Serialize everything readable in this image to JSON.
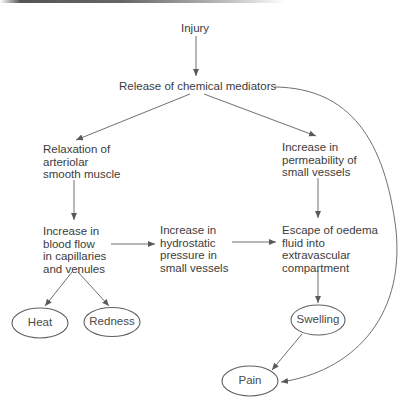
{
  "diagram": {
    "title_implied": "Inflammation cascade",
    "nodes": {
      "injury": {
        "lines": [
          "Injury"
        ]
      },
      "mediators": {
        "lines": [
          "Release of chemical mediators"
        ]
      },
      "relaxation": {
        "lines": [
          "Relaxation of",
          "arteriolar",
          "smooth muscle"
        ]
      },
      "permeability": {
        "lines": [
          "Increase in",
          "permeability of",
          "small vessels"
        ]
      },
      "blood_flow": {
        "lines": [
          "Increase in",
          "blood flow",
          "in capillaries",
          "and venules"
        ]
      },
      "hydrostatic": {
        "lines": [
          "Increase in",
          "hydrostatic",
          "pressure in",
          "small vessels"
        ]
      },
      "oedema": {
        "lines": [
          "Escape of oedema",
          "fluid into",
          "extravascular",
          "compartment"
        ]
      }
    },
    "outcomes": {
      "heat": "Heat",
      "redness": "Redness",
      "swelling": "Swelling",
      "pain": "Pain"
    },
    "edges": [
      [
        "Injury",
        "Release of chemical mediators"
      ],
      [
        "Release of chemical mediators",
        "Relaxation of arteriolar smooth muscle"
      ],
      [
        "Release of chemical mediators",
        "Increase in permeability of small vessels"
      ],
      [
        "Release of chemical mediators",
        "Pain"
      ],
      [
        "Relaxation of arteriolar smooth muscle",
        "Increase in blood flow in capillaries and venules"
      ],
      [
        "Increase in blood flow in capillaries and venules",
        "Increase in hydrostatic pressure in small vessels"
      ],
      [
        "Increase in blood flow in capillaries and venules",
        "Heat"
      ],
      [
        "Increase in blood flow in capillaries and venules",
        "Redness"
      ],
      [
        "Increase in hydrostatic pressure in small vessels",
        "Escape of oedema fluid into extravascular compartment"
      ],
      [
        "Increase in permeability of small vessels",
        "Escape of oedema fluid into extravascular compartment"
      ],
      [
        "Escape of oedema fluid into extravascular compartment",
        "Swelling"
      ],
      [
        "Swelling",
        "Pain"
      ]
    ],
    "colors": {
      "line": "#6a6a6a",
      "text": "#3c3c3c"
    }
  }
}
